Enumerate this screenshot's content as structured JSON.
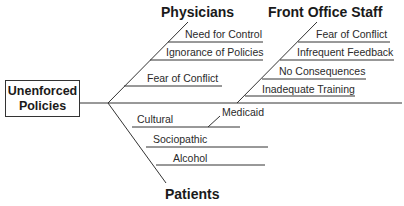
{
  "diagram": {
    "type": "fishbone",
    "effect": {
      "line1": "Unenforced",
      "line2": "Policies"
    },
    "categories": {
      "physicians": {
        "title": "Physicians",
        "causes": [
          "Need for Control",
          "Ignorance of Policies",
          "Fear of Conflict"
        ]
      },
      "front_office": {
        "title": "Front Office Staff",
        "causes": [
          "Fear of Conflict",
          "Infrequent Feedback",
          "No Consequences",
          "Inadequate Training"
        ]
      },
      "patients": {
        "title": "Patients",
        "causes": [
          "Cultural",
          "Sociopathic",
          "Alcohol"
        ],
        "sub_causes": {
          "cultural": "Medicaid"
        }
      }
    },
    "colors": {
      "line": "#333333",
      "text": "#1a1a1a",
      "background": "#ffffff"
    }
  }
}
